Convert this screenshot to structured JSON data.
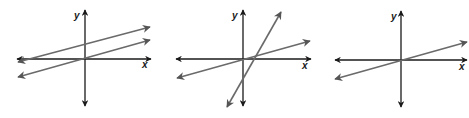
{
  "figure": {
    "axis_labels": {
      "x": "x",
      "y": "y"
    },
    "colors": {
      "axis": "#1a1a1a",
      "line": "#6a6a6a",
      "background": "#ffffff"
    },
    "graphs": [
      {
        "id": "graph-1",
        "case": "parallel lines (no solution)",
        "origin": [
          85,
          59
        ],
        "x_axis": [
          17,
          151
        ],
        "y_axis": [
          10,
          106
        ],
        "x_label_pos": [
          142,
          68
        ],
        "y_label_pos": [
          74,
          19
        ],
        "lines": [
          {
            "from": [
              18,
              62
            ],
            "to": [
              150,
              27
            ]
          },
          {
            "from": [
              18,
              77
            ],
            "to": [
              150,
              40
            ]
          }
        ]
      },
      {
        "id": "graph-2",
        "case": "intersecting lines (one solution)",
        "origin": [
          243,
          59
        ],
        "x_axis": [
          176,
          311
        ],
        "y_axis": [
          10,
          106
        ],
        "x_label_pos": [
          302,
          69
        ],
        "y_label_pos": [
          232,
          19
        ],
        "lines": [
          {
            "from": [
              177,
              78
            ],
            "to": [
              310,
              41
            ]
          },
          {
            "from": [
              227,
              107
            ],
            "to": [
              281,
              12
            ]
          }
        ]
      },
      {
        "id": "graph-3",
        "case": "coincident lines (infinitely many solutions)",
        "origin": [
          401,
          60
        ],
        "x_axis": [
          335,
          467
        ],
        "y_axis": [
          11,
          107
        ],
        "x_label_pos": [
          459,
          70
        ],
        "y_label_pos": [
          391,
          20
        ],
        "lines": [
          {
            "from": [
              335,
              79
            ],
            "to": [
              467,
              42
            ]
          }
        ]
      }
    ]
  }
}
